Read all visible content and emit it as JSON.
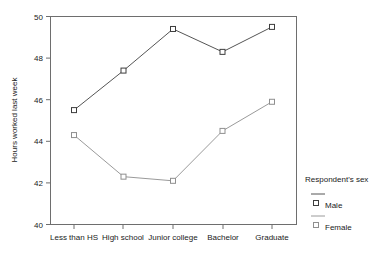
{
  "chart_data": {
    "type": "line",
    "title": "",
    "xlabel": "",
    "ylabel": "Hours worked last week",
    "categories": [
      "Less than HS",
      "High school",
      "Junior college",
      "Bachelor",
      "Graduate"
    ],
    "series": [
      {
        "name": "Male",
        "values": [
          45.5,
          47.4,
          49.4,
          48.3,
          49.5
        ]
      },
      {
        "name": "Female",
        "values": [
          44.3,
          42.3,
          42.1,
          44.5,
          45.9
        ]
      }
    ],
    "ylim": [
      40,
      50
    ],
    "yticks": [
      40,
      42,
      44,
      46,
      48,
      50
    ],
    "ytick_labels": [
      "40",
      "42",
      "44",
      "46",
      "48",
      "50"
    ],
    "grid": false,
    "legend_position": "right",
    "legend_title": "Respondent's sex",
    "marker": "open-square",
    "colors": {
      "male": "#3d3d3d",
      "female": "#9a9a9a",
      "axis": "#6e6e6e"
    }
  }
}
